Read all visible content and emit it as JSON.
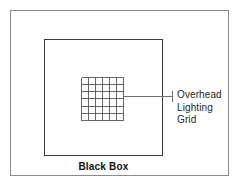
{
  "diagram": {
    "background_color": "#ffffff",
    "outer_frame": {
      "name": "outer-frame",
      "border_color": "#8a8a8a"
    },
    "black_box": {
      "caption": "Black Box",
      "border_color": "#3a3a3a"
    },
    "callout": {
      "lines": [
        "Overhead",
        "Lighting",
        "Grid"
      ],
      "line1": "Overhead",
      "line2": "Lighting",
      "line3": "Grid",
      "text_color": "#262626",
      "leader_color": "#6e6e6e"
    },
    "grid": {
      "columns": 6,
      "rows": 6,
      "line_color": "#555555",
      "border_color": "#555555"
    }
  }
}
